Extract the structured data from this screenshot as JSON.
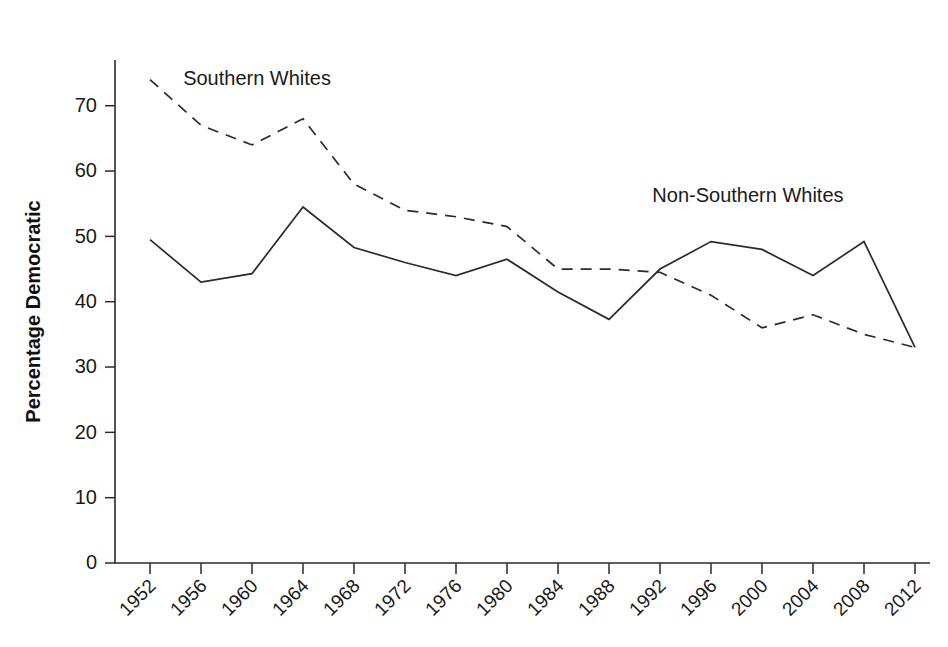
{
  "figure": {
    "cropped_header_text": "",
    "background_color": "#ffffff",
    "ink_color": "#2b2b2b"
  },
  "chart_data": {
    "type": "line",
    "title": "",
    "subtitle": "",
    "xlabel": "",
    "ylabel": "Percentage Democratic",
    "xlim": [
      1952,
      2012
    ],
    "ylim": [
      0,
      77
    ],
    "ytick_values": [
      0,
      10,
      20,
      30,
      40,
      50,
      60,
      70
    ],
    "ytick_labels": [
      "0",
      "10",
      "20",
      "30",
      "40",
      "50",
      "60",
      "70"
    ],
    "grid": false,
    "legend_position": "inline-annotations",
    "categories": [
      1952,
      1956,
      1960,
      1964,
      1968,
      1972,
      1976,
      1980,
      1984,
      1988,
      1992,
      1996,
      2000,
      2004,
      2008,
      2012
    ],
    "xtick_labels": [
      "1952",
      "1956",
      "1960",
      "1964",
      "1968",
      "1972",
      "1976",
      "1980",
      "1984",
      "1988",
      "1992",
      "1996",
      "2000",
      "2004",
      "2008",
      "2012"
    ],
    "series": [
      {
        "name": "Southern Whites",
        "style": "dashed",
        "color": "#2b2b2b",
        "label_x": 1954.6,
        "label_y": 73.2,
        "values": [
          74.0,
          67.0,
          64.0,
          68.0,
          58.0,
          54.0,
          53.0,
          51.5,
          45.0,
          45.0,
          44.5,
          41.0,
          36.0,
          38.0,
          35.0,
          33.0
        ]
      },
      {
        "name": "Non-Southern Whites",
        "style": "solid",
        "color": "#2b2b2b",
        "label_x": 1991.4,
        "label_y": 55.2,
        "values": [
          49.5,
          43.0,
          44.3,
          54.5,
          48.3,
          46.0,
          44.0,
          46.5,
          41.5,
          37.3,
          45.0,
          49.2,
          48.0,
          44.0,
          49.2,
          33.0
        ]
      }
    ],
    "annotations": [
      {
        "text": "Southern Whites",
        "series": "Southern Whites"
      },
      {
        "text": "Non-Southern Whites",
        "series": "Non-Southern Whites"
      }
    ]
  }
}
